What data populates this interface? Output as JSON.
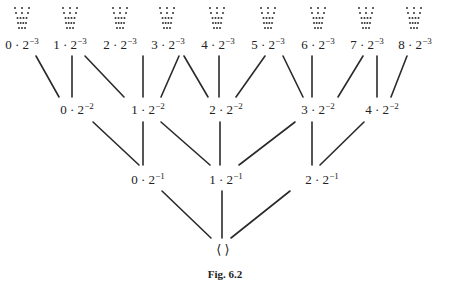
{
  "figure": {
    "caption": "Fig. 6.2",
    "root_label": "⟨ ⟩",
    "levels": [
      {
        "exponent": "−3",
        "nodes": [
          {
            "num": "0",
            "label": "0 · 2−3"
          },
          {
            "num": "1",
            "label": "1 · 2−3"
          },
          {
            "num": "2",
            "label": "2 · 2−3"
          },
          {
            "num": "3",
            "label": "3 · 2−3"
          },
          {
            "num": "4",
            "label": "4 · 2−3"
          },
          {
            "num": "5",
            "label": "5 · 2−3"
          },
          {
            "num": "6",
            "label": "6 · 2−3"
          },
          {
            "num": "7",
            "label": "7 · 2−3"
          },
          {
            "num": "8",
            "label": "8 · 2−3"
          }
        ]
      },
      {
        "exponent": "−2",
        "nodes": [
          {
            "num": "0",
            "label": "0 · 2−2"
          },
          {
            "num": "1",
            "label": "1 · 2−2"
          },
          {
            "num": "2",
            "label": "2 · 2−2"
          },
          {
            "num": "3",
            "label": "3 · 2−2"
          },
          {
            "num": "4",
            "label": "4 · 2−2"
          }
        ]
      },
      {
        "exponent": "−1",
        "nodes": [
          {
            "num": "0",
            "label": "0 · 2−1"
          },
          {
            "num": "1",
            "label": "1 · 2−1"
          },
          {
            "num": "2",
            "label": "2 · 2−1"
          }
        ]
      }
    ],
    "edges": [
      [
        "0·2^-3",
        "0·2^-2"
      ],
      [
        "1·2^-3",
        "0·2^-2"
      ],
      [
        "1·2^-3",
        "1·2^-2"
      ],
      [
        "2·2^-3",
        "1·2^-2"
      ],
      [
        "3·2^-3",
        "1·2^-2"
      ],
      [
        "3·2^-3",
        "2·2^-2"
      ],
      [
        "4·2^-3",
        "2·2^-2"
      ],
      [
        "5·2^-3",
        "2·2^-2"
      ],
      [
        "5·2^-3",
        "3·2^-2"
      ],
      [
        "6·2^-3",
        "3·2^-2"
      ],
      [
        "7·2^-3",
        "3·2^-2"
      ],
      [
        "7·2^-3",
        "4·2^-2"
      ],
      [
        "8·2^-3",
        "4·2^-2"
      ],
      [
        "0·2^-2",
        "0·2^-1"
      ],
      [
        "1·2^-2",
        "0·2^-1"
      ],
      [
        "1·2^-2",
        "1·2^-1"
      ],
      [
        "2·2^-2",
        "1·2^-1"
      ],
      [
        "3·2^-2",
        "1·2^-1"
      ],
      [
        "3·2^-2",
        "2·2^-1"
      ],
      [
        "4·2^-2",
        "2·2^-1"
      ],
      [
        "0·2^-1",
        "⟨ ⟩"
      ],
      [
        "1·2^-1",
        "⟨ ⟩"
      ],
      [
        "2·2^-1",
        "⟨ ⟩"
      ]
    ]
  }
}
